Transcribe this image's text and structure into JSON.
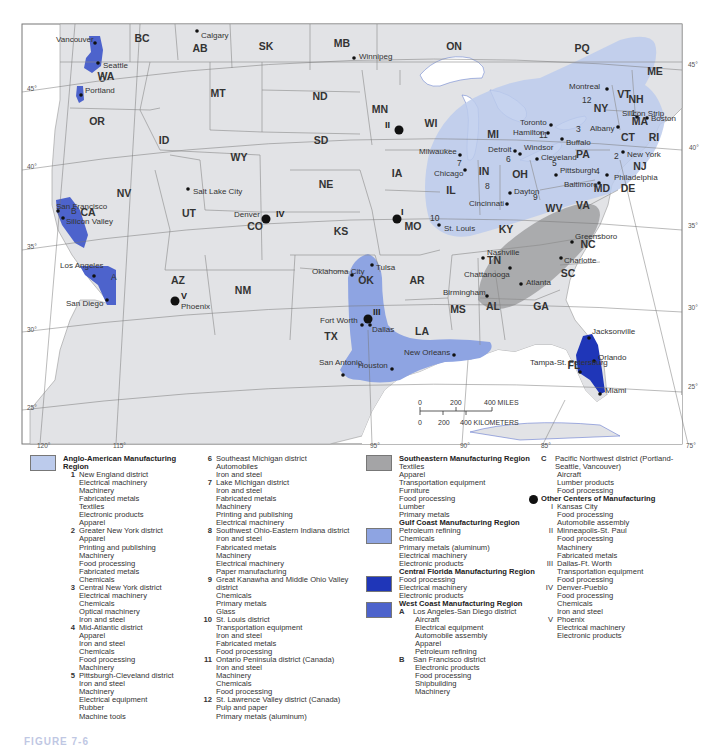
{
  "colors": {
    "land": "#e2e3e6",
    "water": "#ffffff",
    "border": "#777777",
    "anglo_american": "#bccbec",
    "southeastern": "#a4a4a6",
    "gulf_coast": "#8ea4e2",
    "central_florida": "#1f36b8",
    "west_coast": "#4d63cc",
    "other_center_dot": "#111111"
  },
  "map": {
    "states": [
      {
        "label": "BC",
        "x": 142,
        "y": 42
      },
      {
        "label": "AB",
        "x": 200,
        "y": 52
      },
      {
        "label": "SK",
        "x": 266,
        "y": 50
      },
      {
        "label": "MB",
        "x": 342,
        "y": 47
      },
      {
        "label": "ON",
        "x": 454,
        "y": 50
      },
      {
        "label": "PQ",
        "x": 582,
        "y": 52
      },
      {
        "label": "WA",
        "x": 106,
        "y": 80
      },
      {
        "label": "MT",
        "x": 218,
        "y": 97
      },
      {
        "label": "ND",
        "x": 320,
        "y": 100
      },
      {
        "label": "MN",
        "x": 380,
        "y": 113
      },
      {
        "label": "WI",
        "x": 431,
        "y": 127
      },
      {
        "label": "OR",
        "x": 97,
        "y": 125
      },
      {
        "label": "ID",
        "x": 164,
        "y": 144
      },
      {
        "label": "SD",
        "x": 321,
        "y": 144
      },
      {
        "label": "WY",
        "x": 239,
        "y": 161
      },
      {
        "label": "IA",
        "x": 397,
        "y": 177
      },
      {
        "label": "NE",
        "x": 326,
        "y": 188
      },
      {
        "label": "NV",
        "x": 124,
        "y": 197
      },
      {
        "label": "UT",
        "x": 189,
        "y": 217
      },
      {
        "label": "CO",
        "x": 255,
        "y": 230
      },
      {
        "label": "KS",
        "x": 341,
        "y": 235
      },
      {
        "label": "MO",
        "x": 413,
        "y": 230
      },
      {
        "label": "CA",
        "x": 88,
        "y": 216
      },
      {
        "label": "AZ",
        "x": 178,
        "y": 284
      },
      {
        "label": "NM",
        "x": 243,
        "y": 294
      },
      {
        "label": "OK",
        "x": 366,
        "y": 284
      },
      {
        "label": "AR",
        "x": 417,
        "y": 284
      },
      {
        "label": "TX",
        "x": 331,
        "y": 340
      },
      {
        "label": "LA",
        "x": 422,
        "y": 335
      },
      {
        "label": "MS",
        "x": 458,
        "y": 313
      },
      {
        "label": "AL",
        "x": 493,
        "y": 310
      },
      {
        "label": "GA",
        "x": 541,
        "y": 310
      },
      {
        "label": "TN",
        "x": 494,
        "y": 264
      },
      {
        "label": "KY",
        "x": 506,
        "y": 233
      },
      {
        "label": "IL",
        "x": 451,
        "y": 194
      },
      {
        "label": "IN",
        "x": 484,
        "y": 175
      },
      {
        "label": "OH",
        "x": 520,
        "y": 178
      },
      {
        "label": "MI",
        "x": 493,
        "y": 138
      },
      {
        "label": "WV",
        "x": 554,
        "y": 212
      },
      {
        "label": "VA",
        "x": 583,
        "y": 209
      },
      {
        "label": "NC",
        "x": 588,
        "y": 248
      },
      {
        "label": "SC",
        "x": 568,
        "y": 277
      },
      {
        "label": "FL",
        "x": 574,
        "y": 369
      },
      {
        "label": "PA",
        "x": 583,
        "y": 158
      },
      {
        "label": "NY",
        "x": 601,
        "y": 112
      },
      {
        "label": "VT",
        "x": 624,
        "y": 98
      },
      {
        "label": "NH",
        "x": 636,
        "y": 103
      },
      {
        "label": "ME",
        "x": 655,
        "y": 75
      },
      {
        "label": "MA",
        "x": 640,
        "y": 125
      },
      {
        "label": "CT",
        "x": 628,
        "y": 141
      },
      {
        "label": "RI",
        "x": 654,
        "y": 141
      },
      {
        "label": "NJ",
        "x": 640,
        "y": 170
      },
      {
        "label": "MD",
        "x": 602,
        "y": 192
      },
      {
        "label": "DE",
        "x": 628,
        "y": 192
      }
    ],
    "cities": [
      {
        "label": "Vancouver",
        "x": 95,
        "y": 43,
        "lx": 56,
        "ly": 42
      },
      {
        "label": "Seattle",
        "x": 98,
        "y": 63,
        "lx": 103,
        "ly": 68
      },
      {
        "label": "Portland",
        "x": 81,
        "y": 95,
        "lx": 85,
        "ly": 93
      },
      {
        "label": "Calgary",
        "x": 197,
        "y": 31,
        "lx": 201,
        "ly": 38
      },
      {
        "label": "Winnipeg",
        "x": 354,
        "y": 58,
        "lx": 359,
        "ly": 59
      },
      {
        "label": "San Francisco",
        "x": 58,
        "y": 211,
        "lx": 56,
        "ly": 209
      },
      {
        "label": "Silicon Valley",
        "x": 63,
        "y": 218,
        "lx": 66,
        "ly": 224
      },
      {
        "label": "Los Angeles",
        "x": 94,
        "y": 276,
        "lx": 60,
        "ly": 268
      },
      {
        "label": "San Diego",
        "x": 107,
        "y": 300,
        "lx": 66,
        "ly": 306
      },
      {
        "label": "Salt Lake City",
        "x": 188,
        "y": 189,
        "lx": 193,
        "ly": 194
      },
      {
        "label": "Denver",
        "x": 267,
        "y": 219,
        "lx": 234,
        "ly": 217
      },
      {
        "label": "Phoenix",
        "x": 175,
        "y": 300,
        "lx": 181,
        "ly": 309
      },
      {
        "label": "Oklahoma City",
        "x": 352,
        "y": 275,
        "lx": 312,
        "ly": 274
      },
      {
        "label": "Tulsa",
        "x": 372,
        "y": 265,
        "lx": 376,
        "ly": 270
      },
      {
        "label": "Fort Worth",
        "x": 362,
        "y": 325,
        "lx": 320,
        "ly": 323
      },
      {
        "label": "Dallas",
        "x": 370,
        "y": 325,
        "lx": 372,
        "ly": 332
      },
      {
        "label": "San Antonio",
        "x": 343,
        "y": 375,
        "lx": 319,
        "ly": 365
      },
      {
        "label": "Houston",
        "x": 392,
        "y": 369,
        "lx": 358,
        "ly": 368
      },
      {
        "label": "New Orleans",
        "x": 454,
        "y": 355,
        "lx": 404,
        "ly": 355
      },
      {
        "label": "Birmingham",
        "x": 487,
        "y": 296,
        "lx": 443,
        "ly": 295
      },
      {
        "label": "Atlanta",
        "x": 521,
        "y": 284,
        "lx": 526,
        "ly": 285
      },
      {
        "label": "Chattanooga",
        "x": 510,
        "y": 268,
        "lx": 464,
        "ly": 277
      },
      {
        "label": "Nashville",
        "x": 483,
        "y": 258,
        "lx": 487,
        "ly": 255
      },
      {
        "label": "Greensboro",
        "x": 572,
        "y": 242,
        "lx": 575,
        "ly": 239
      },
      {
        "label": "Charlotte",
        "x": 561,
        "y": 258,
        "lx": 564,
        "ly": 263
      },
      {
        "label": "St. Louis",
        "x": 439,
        "y": 225,
        "lx": 444,
        "ly": 231
      },
      {
        "label": "Cincinnati",
        "x": 507,
        "y": 204,
        "lx": 469,
        "ly": 206
      },
      {
        "label": "Dayton",
        "x": 510,
        "y": 193,
        "lx": 514,
        "ly": 194
      },
      {
        "label": "Chicago",
        "x": 465,
        "y": 170,
        "lx": 434,
        "ly": 176
      },
      {
        "label": "Milwaukee",
        "x": 460,
        "y": 155,
        "lx": 419,
        "ly": 154
      },
      {
        "label": "Detroit",
        "x": 515,
        "y": 151,
        "lx": 488,
        "ly": 152
      },
      {
        "label": "Windsor",
        "x": 520,
        "y": 154,
        "lx": 524,
        "ly": 150
      },
      {
        "label": "Toronto",
        "x": 551,
        "y": 125,
        "lx": 520,
        "ly": 125
      },
      {
        "label": "Hamilton",
        "x": 548,
        "y": 133,
        "lx": 513,
        "ly": 135
      },
      {
        "label": "Buffalo",
        "x": 562,
        "y": 139,
        "lx": 566,
        "ly": 145
      },
      {
        "label": "Cleveland",
        "x": 537,
        "y": 159,
        "lx": 541,
        "ly": 160
      },
      {
        "label": "Pittsburgh",
        "x": 556,
        "y": 175,
        "lx": 560,
        "ly": 173
      },
      {
        "label": "Baltimore",
        "x": 599,
        "y": 183,
        "lx": 564,
        "ly": 187
      },
      {
        "label": "Philadelphia",
        "x": 607,
        "y": 175,
        "lx": 614,
        "ly": 180
      },
      {
        "label": "New York",
        "x": 623,
        "y": 152,
        "lx": 627,
        "ly": 157
      },
      {
        "label": "Albany",
        "x": 618,
        "y": 127,
        "lx": 590,
        "ly": 131
      },
      {
        "label": "Silicon Strip",
        "x": 637,
        "y": 117,
        "lx": 622,
        "ly": 116
      },
      {
        "label": "Boston",
        "x": 647,
        "y": 118,
        "lx": 651,
        "ly": 121
      },
      {
        "label": "Montreal",
        "x": 607,
        "y": 89,
        "lx": 569,
        "ly": 89
      },
      {
        "label": "Jacksonville",
        "x": 589,
        "y": 338,
        "lx": 592,
        "ly": 334
      },
      {
        "label": "Orlando",
        "x": 594,
        "y": 361,
        "lx": 598,
        "ly": 360
      },
      {
        "label": "Tampa-St. Petersburg",
        "x": 580,
        "y": 372,
        "lx": 530,
        "ly": 365
      },
      {
        "label": "Miami",
        "x": 600,
        "y": 394,
        "lx": 605,
        "ly": 393
      }
    ],
    "district_numbers": [
      {
        "label": "1",
        "x": 631,
        "y": 116
      },
      {
        "label": "2",
        "x": 614,
        "y": 159
      },
      {
        "label": "3",
        "x": 576,
        "y": 132
      },
      {
        "label": "4",
        "x": 595,
        "y": 174
      },
      {
        "label": "5",
        "x": 552,
        "y": 166
      },
      {
        "label": "6",
        "x": 506,
        "y": 162
      },
      {
        "label": "7",
        "x": 457,
        "y": 166
      },
      {
        "label": "8",
        "x": 485,
        "y": 189
      },
      {
        "label": "9",
        "x": 533,
        "y": 200
      },
      {
        "label": "10",
        "x": 430,
        "y": 221
      },
      {
        "label": "11",
        "x": 539,
        "y": 138
      },
      {
        "label": "12",
        "x": 582,
        "y": 103
      }
    ],
    "west_coast_letters": [
      {
        "label": "A",
        "x": 111,
        "y": 280
      },
      {
        "label": "B",
        "x": 71,
        "y": 214
      },
      {
        "label": "C",
        "x": 99,
        "y": 82
      }
    ],
    "other_centers": [
      {
        "label": "I",
        "x": 397,
        "y": 219,
        "lx": 401,
        "ly": 215
      },
      {
        "label": "II",
        "x": 399,
        "y": 130,
        "lx": 385,
        "ly": 128
      },
      {
        "label": "III",
        "x": 368,
        "y": 319,
        "lx": 373,
        "ly": 315
      },
      {
        "label": "IV",
        "x": 266,
        "y": 219,
        "lx": 276,
        "ly": 217
      },
      {
        "label": "V",
        "x": 175,
        "y": 301,
        "lx": 181,
        "ly": 299
      }
    ],
    "latitude_labels": [
      {
        "label": "45°",
        "x": 27,
        "y": 91
      },
      {
        "label": "40°",
        "x": 27,
        "y": 169
      },
      {
        "label": "35°",
        "x": 27,
        "y": 249
      },
      {
        "label": "30°",
        "x": 27,
        "y": 332
      },
      {
        "label": "25°",
        "x": 27,
        "y": 410
      },
      {
        "label": "45°",
        "x": 688,
        "y": 67
      },
      {
        "label": "40°",
        "x": 689,
        "y": 150
      },
      {
        "label": "35°",
        "x": 688,
        "y": 228
      },
      {
        "label": "30°",
        "x": 688,
        "y": 310
      },
      {
        "label": "25°",
        "x": 688,
        "y": 389
      }
    ],
    "longitude_labels": [
      {
        "label": "120°",
        "x": 37,
        "y": 448
      },
      {
        "label": "115°",
        "x": 113,
        "y": 448
      },
      {
        "label": "95°",
        "x": 370,
        "y": 448
      },
      {
        "label": "90°",
        "x": 460,
        "y": 448
      },
      {
        "label": "85°",
        "x": 541,
        "y": 448
      },
      {
        "label": "75°",
        "x": 686,
        "y": 448
      }
    ],
    "scale": {
      "miles_ticks": [
        "0",
        "200",
        "400 MILES"
      ],
      "km_ticks": [
        "0",
        "200",
        "400 KILOMETERS"
      ]
    }
  },
  "legend": {
    "anglo_american": {
      "title": "Anglo-American Manufacturing Region",
      "districts": [
        {
          "num": "1",
          "name": "New England district",
          "items": [
            "Electrical machinery",
            "Machinery",
            "Fabricated metals",
            "Textiles",
            "Electronic products",
            "Apparel"
          ]
        },
        {
          "num": "2",
          "name": "Greater New York district",
          "items": [
            "Apparel",
            "Printing and publishing",
            "Machinery",
            "Food processing",
            "Fabricated metals",
            "Chemicals"
          ]
        },
        {
          "num": "3",
          "name": "Central New York district",
          "items": [
            "Electrical machinery",
            "Chemicals",
            "Optical machinery",
            "Iron and steel"
          ]
        },
        {
          "num": "4",
          "name": "Mid-Atlantic district",
          "items": [
            "Apparel",
            "Iron and steel",
            "Chemicals",
            "Food processing",
            "Machinery"
          ]
        },
        {
          "num": "5",
          "name": "Pittsburgh-Cleveland district",
          "items": [
            "Iron and steel",
            "Machinery",
            "Electrical equipment",
            "Rubber",
            "Machine tools"
          ]
        },
        {
          "num": "6",
          "name": "Southeast Michigan district",
          "items": [
            "Automobiles",
            "Iron and steel"
          ]
        },
        {
          "num": "7",
          "name": "Lake Michigan district",
          "items": [
            "Iron and steel",
            "Fabricated metals",
            "Machinery",
            "Printing and publishing",
            "Electrical machinery"
          ]
        },
        {
          "num": "8",
          "name": "Southwest Ohio-Eastern Indiana district",
          "items": [
            "Iron and steel",
            "Fabricated metals",
            "Machinery",
            "Electrical machinery",
            "Paper manufacturing"
          ]
        },
        {
          "num": "9",
          "name": "Great Kanawha and Middle Ohio Valley district",
          "items": [
            "Chemicals",
            "Primary metals",
            "Glass"
          ]
        },
        {
          "num": "10",
          "name": "St. Louis district",
          "items": [
            "Transportation equipment",
            "Iron and steel",
            "Fabricated metals",
            "Food processing"
          ]
        },
        {
          "num": "11",
          "name": "Ontario Peninsula district (Canada)",
          "items": [
            "Iron and steel",
            "Machinery",
            "Chemicals",
            "Food processing"
          ]
        },
        {
          "num": "12",
          "name": "St. Lawrence Valley district (Canada)",
          "items": [
            "Pulp and paper",
            "Primary metals (aluminum)"
          ]
        }
      ]
    },
    "southeastern": {
      "title": "Southeastern Manufacturing Region",
      "items": [
        "Textiles",
        "Apparel",
        "Transportation equipment",
        "Furniture",
        "Food processing",
        "Lumber",
        "Primary metals"
      ]
    },
    "gulf_coast": {
      "title": "Gulf Coast Manufacturing Region",
      "items": [
        "Petroleum refining",
        "Chemicals",
        "Primary metals (aluminum)",
        "Electrical machinery",
        "Electronic products"
      ]
    },
    "central_florida": {
      "title": "Central Florida Manufacturing Region",
      "items": [
        "Food processing",
        "Electrical machinery",
        "Electronic products"
      ]
    },
    "west_coast": {
      "title": "West Coast Manufacturing Region",
      "districts": [
        {
          "num": "A",
          "name": "Los Angeles-San Diego district",
          "items": [
            "Aircraft",
            "Electrical equipment",
            "Automobile assembly",
            "Apparel",
            "Petroleum refining"
          ]
        },
        {
          "num": "B",
          "name": "San Francisco district",
          "items": [
            "Electronic products",
            "Food processing",
            "Shipbuilding",
            "Machinery"
          ]
        },
        {
          "num": "C",
          "name": "Pacific Northwest district (Portland-Seattle, Vancouver)",
          "items": [
            "Aircraft",
            "Lumber products",
            "Food processing"
          ]
        }
      ]
    },
    "other_centers": {
      "title": "Other Centers of Manufacturing",
      "centers": [
        {
          "num": "I",
          "name": "Kansas City",
          "items": [
            "Food processing",
            "Automobile assembly"
          ]
        },
        {
          "num": "II",
          "name": "Minneapolis-St. Paul",
          "items": [
            "Food processing",
            "Machinery",
            "Fabricated metals"
          ]
        },
        {
          "num": "III",
          "name": "Dallas-Ft. Worth",
          "items": [
            "Transportation equipment",
            "Food processing"
          ]
        },
        {
          "num": "IV",
          "name": "Denver-Pueblo",
          "items": [
            "Food processing",
            "Chemicals",
            "Iron and steel"
          ]
        },
        {
          "num": "V",
          "name": "Phoenix",
          "items": [
            "Electrical machinery",
            "Electronic products"
          ]
        }
      ]
    }
  },
  "figure_caption": "FIGURE 7-6"
}
